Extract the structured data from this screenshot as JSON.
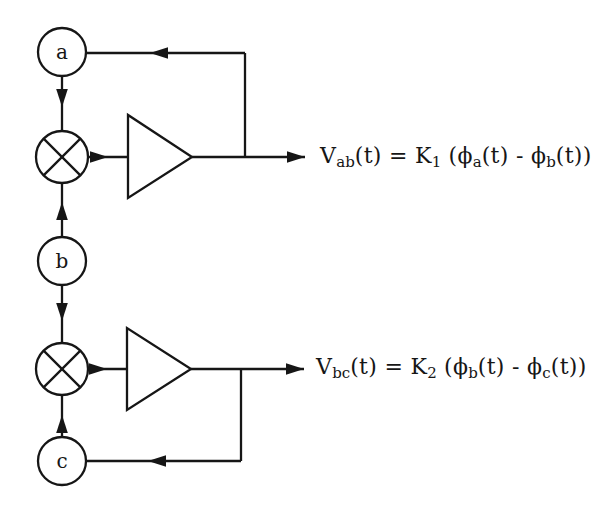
{
  "page": {
    "background": "#ffffff"
  },
  "diagram": {
    "line_color": "#161616",
    "shape_fill": "#ffffff",
    "nodes": [
      {
        "id": "a",
        "label": "a"
      },
      {
        "id": "b",
        "label": "b"
      },
      {
        "id": "c",
        "label": "c"
      }
    ]
  },
  "equations": {
    "vab": {
      "parts": [
        {
          "text": "V",
          "sub": false
        },
        {
          "text": "ab",
          "sub": true
        },
        {
          "text": "(t) = K",
          "sub": false
        },
        {
          "text": "1",
          "sub": true
        },
        {
          "text": " (ϕ",
          "sub": false
        },
        {
          "text": "a",
          "sub": true
        },
        {
          "text": "(t) - ϕ",
          "sub": false
        },
        {
          "text": "b",
          "sub": true
        },
        {
          "text": "(t))",
          "sub": false
        }
      ]
    },
    "vbc": {
      "parts": [
        {
          "text": "V",
          "sub": false
        },
        {
          "text": "bc",
          "sub": true
        },
        {
          "text": "(t) = K",
          "sub": false
        },
        {
          "text": "2",
          "sub": true
        },
        {
          "text": " (ϕ",
          "sub": false
        },
        {
          "text": "b",
          "sub": true
        },
        {
          "text": "(t) - ϕ",
          "sub": false
        },
        {
          "text": "c",
          "sub": true
        },
        {
          "text": "(t))",
          "sub": false
        }
      ]
    }
  }
}
